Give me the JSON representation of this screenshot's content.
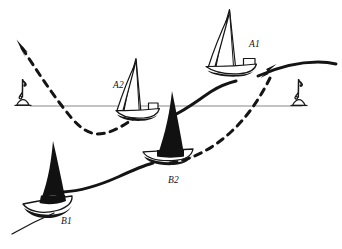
{
  "diagram": {
    "background_color": "#ffffff",
    "ink_color": "#111111",
    "reference_line_color": "#8a8a8a",
    "width": 342,
    "height": 249
  },
  "reference_line": {
    "name": "start-line",
    "x1": 30,
    "y1": 106,
    "x2": 302,
    "y2": 106
  },
  "marks": [
    {
      "id": "mark-left",
      "label": "",
      "x": 24,
      "y": 106
    },
    {
      "id": "mark-right",
      "label": "",
      "x": 300,
      "y": 106
    }
  ],
  "boats": [
    {
      "id": "A1",
      "label": "A1",
      "label_x": 249,
      "label_y": 47,
      "sail_fill": "#ffffff",
      "hull_fill": "#ffffff",
      "hull_stroke": "#111111",
      "x": 232,
      "y": 72
    },
    {
      "id": "A2",
      "label": "A2",
      "label_x": 113,
      "label_y": 88,
      "sail_fill": "#ffffff",
      "hull_fill": "#ffffff",
      "hull_stroke": "#111111",
      "x": 136,
      "y": 115
    },
    {
      "id": "B1",
      "label": "B1",
      "label_x": 61,
      "label_y": 224,
      "sail_fill": "#111111",
      "hull_fill": "#ffffff",
      "hull_stroke": "#111111",
      "x": 50,
      "y": 196
    },
    {
      "id": "B2",
      "label": "B2",
      "label_x": 168,
      "label_y": 183,
      "sail_fill": "#111111",
      "hull_fill": "#ffffff",
      "hull_stroke": "#111111",
      "x": 160,
      "y": 158
    }
  ],
  "tracks": [
    {
      "id": "track-solid-A",
      "style": "solid",
      "description": "Solid course line through A2 and A1 continuing to right edge"
    },
    {
      "id": "track-solid-B",
      "style": "solid",
      "description": "Solid course line through B1 and B2"
    },
    {
      "id": "track-dashed",
      "style": "dashed",
      "description": "Dashed course line dipping below the line then rising right"
    }
  ],
  "arrows": [
    {
      "id": "arrow-upper-left",
      "direction": "up-left",
      "x": 18,
      "y": 42
    },
    {
      "id": "arrow-upper-right",
      "direction": "up-right",
      "x": 274,
      "y": 67
    }
  ]
}
